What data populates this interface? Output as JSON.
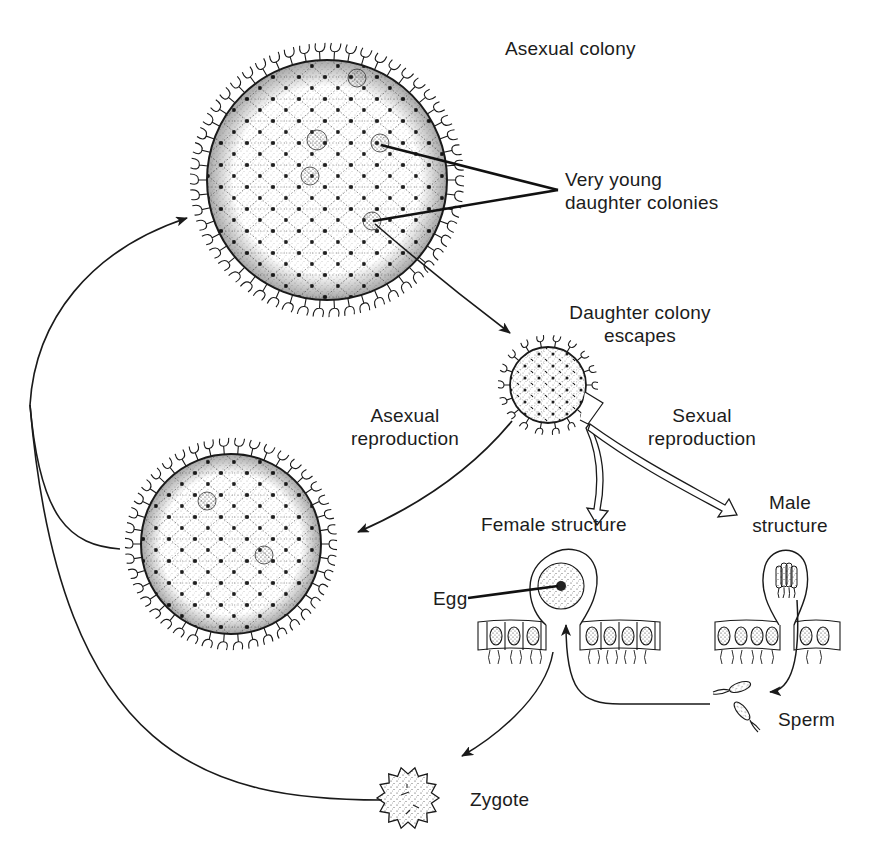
{
  "diagram": {
    "type": "life-cycle",
    "colors": {
      "ink": "#1a1a1a",
      "background": "#ffffff",
      "stipple": "#2b2b2b"
    }
  },
  "labels": {
    "asexual_colony": "Asexual colony",
    "very_young_daughter": {
      "line1": "Very young",
      "line2": "daughter colonies"
    },
    "daughter_escapes": {
      "line1": "Daughter colony",
      "line2": "escapes"
    },
    "asexual_reproduction": {
      "line1": "Asexual",
      "line2": "reproduction"
    },
    "sexual_reproduction": {
      "line1": "Sexual",
      "line2": "reproduction"
    },
    "female_structure": "Female structure",
    "male_structure": {
      "line1": "Male",
      "line2": "structure"
    },
    "egg": "Egg",
    "sperm": "Sperm",
    "zygote": "Zygote"
  },
  "nodes": [
    {
      "id": "asexual-colony",
      "label": "Asexual colony"
    },
    {
      "id": "daughter-colony",
      "label": "Daughter colony escapes"
    },
    {
      "id": "mature-colony",
      "label": ""
    },
    {
      "id": "female-structure",
      "label": "Female structure"
    },
    {
      "id": "male-structure",
      "label": "Male structure"
    },
    {
      "id": "sperm",
      "label": "Sperm"
    },
    {
      "id": "zygote",
      "label": "Zygote"
    }
  ],
  "edges": [
    {
      "from": "asexual-colony",
      "to": "daughter-colony",
      "style": "solid-arrow"
    },
    {
      "from": "daughter-colony",
      "to": "mature-colony",
      "label": "Asexual reproduction",
      "style": "solid-arrow"
    },
    {
      "from": "daughter-colony",
      "to": "female-structure",
      "label": "Sexual reproduction",
      "style": "hollow-arrow"
    },
    {
      "from": "daughter-colony",
      "to": "male-structure",
      "label": "Sexual reproduction",
      "style": "hollow-arrow"
    },
    {
      "from": "male-structure",
      "to": "sperm",
      "style": "solid-arrow"
    },
    {
      "from": "sperm",
      "to": "female-structure",
      "style": "solid-arrow"
    },
    {
      "from": "female-structure",
      "to": "zygote",
      "style": "solid-arrow"
    },
    {
      "from": "zygote",
      "to": "asexual-colony",
      "style": "solid-arrow"
    },
    {
      "from": "mature-colony",
      "to": "asexual-colony",
      "style": "solid-arrow"
    }
  ]
}
